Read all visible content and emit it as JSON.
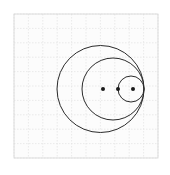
{
  "figure": {
    "canvas": {
      "width": 170,
      "height": 175
    },
    "background_color": "#ffffff"
  },
  "plot_area": {
    "x": 14,
    "y": 14,
    "width": 144,
    "height": 144,
    "border_color": "#d4d4d4",
    "border_width": 0.8,
    "fill_color": "#fcfcfc"
  },
  "grid": {
    "visible": true,
    "color": "#e2e2e2",
    "line_width": 0.7,
    "dash": "1.5 1.5",
    "spacing": 14.4,
    "x_lines": [
      14,
      28.4,
      42.8,
      57.2,
      71.6,
      86,
      100.4,
      114.8,
      129.2,
      143.6,
      158
    ],
    "y_lines": [
      14,
      28.4,
      42.8,
      57.2,
      71.6,
      86,
      100.4,
      114.8,
      129.2,
      143.6,
      158
    ]
  },
  "chart_data": {
    "type": "scatter",
    "title": "",
    "xlabel": "",
    "ylabel": "",
    "xlim": [
      14,
      158
    ],
    "ylim": [
      14,
      158
    ],
    "grid": true,
    "legend": "none",
    "shapes": [
      {
        "name": "outer-circle",
        "type": "circle",
        "cx": 100.5,
        "cy": 89,
        "r": 43.5,
        "stroke": "#2b2b2b",
        "stroke_width": 1.0,
        "fill": "none"
      },
      {
        "name": "middle-circle",
        "type": "circle",
        "cx": 113,
        "cy": 89,
        "r": 31,
        "stroke": "#2b2b2b",
        "stroke_width": 1.0,
        "fill": "none"
      },
      {
        "name": "inner-circle",
        "type": "circle",
        "cx": 131,
        "cy": 89,
        "r": 13,
        "stroke": "#2b2b2b",
        "stroke_width": 1.0,
        "fill": "none"
      }
    ],
    "points": [
      {
        "name": "outer-center-dot",
        "x": 103,
        "y": 89,
        "r": 2.0,
        "color": "#1a1a1a"
      },
      {
        "name": "middle-center-dot",
        "x": 118,
        "y": 89,
        "r": 2.0,
        "color": "#1a1a1a"
      },
      {
        "name": "inner-center-dot",
        "x": 133,
        "y": 89,
        "r": 2.0,
        "color": "#1a1a1a"
      }
    ],
    "tangent_point": {
      "x": 144,
      "y": 89
    }
  }
}
